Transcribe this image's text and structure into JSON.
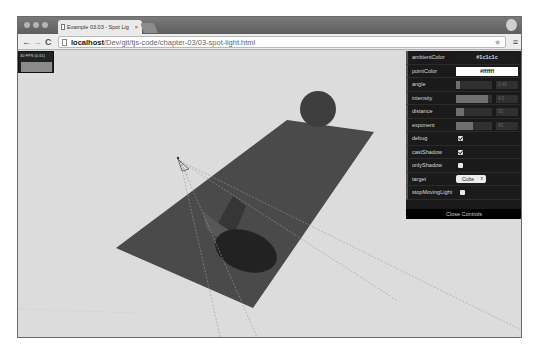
{
  "browser": {
    "tab_title": "Example 03.03 - Spot Lig",
    "tab_close": "×",
    "url_host": "localhost",
    "url_path": "/Dev/git/tjs-code/chapter-03/03-spot-light.html",
    "back_glyph": "←",
    "forward_glyph": "→",
    "reload_glyph": "C",
    "star_glyph": "★",
    "menu_glyph": "≡"
  },
  "stats": {
    "fps_text": "30 FPS (0-61)"
  },
  "gui": {
    "rows": {
      "ambientColor": {
        "label": "ambientColor",
        "value": "#1c1c1c"
      },
      "pointColor": {
        "label": "pointColor",
        "value": "#ffffff"
      },
      "angle": {
        "label": "angle",
        "value": "0.40",
        "fill_pct": 12
      },
      "intensity": {
        "label": "intensity",
        "value": "4.5",
        "fill_pct": 90
      },
      "distance": {
        "label": "distance",
        "value": "30",
        "fill_pct": 22
      },
      "exponent": {
        "label": "exponent",
        "value": "43",
        "fill_pct": 48
      },
      "debug": {
        "label": "debug",
        "checked": true
      },
      "castShadow": {
        "label": "castShadow",
        "checked": true
      },
      "onlyShadow": {
        "label": "onlyShadow",
        "checked": false
      },
      "target": {
        "label": "target",
        "value": "Cube",
        "arrow": "⇕"
      },
      "stopMovingLight": {
        "label": "stopMovingLight",
        "checked": false
      }
    },
    "close_label": "Close Controls"
  },
  "scene": {
    "background": "#dcdcdc",
    "plane_color": "#4a4a4a",
    "sphere_color": "#3e3e3e",
    "cube_color": "#3a3a3a",
    "shadow_color": "#222222"
  }
}
